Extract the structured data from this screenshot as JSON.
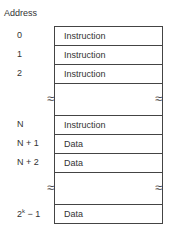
{
  "title": "Address",
  "rows": [
    {
      "address": "0",
      "content": "Instruction"
    },
    {
      "address": "1",
      "content": "Instruction"
    },
    {
      "address": "2",
      "content": "Instruction"
    },
    {
      "address": "N",
      "content": "Instruction"
    },
    {
      "address": "N + 1",
      "content": "Data"
    },
    {
      "address": "N + 2",
      "content": "Data"
    },
    {
      "address_base": "2",
      "address_exp": "k",
      "address_suffix": " − 1",
      "content": "Data"
    }
  ],
  "break_symbol": "≈"
}
